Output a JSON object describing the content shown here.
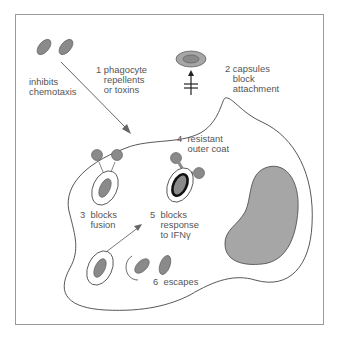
{
  "figure": {
    "colors": {
      "bacterium_fill": "#8a8a8a",
      "nucleus_fill": "#a6a6a6",
      "outline": "#444444",
      "frame": "#9a9a9a",
      "text": "#555555"
    },
    "labels": {
      "inhibits": "inhibits\nchemotaxis",
      "m1": "1 phagocyte\n   repellents\n   or toxins",
      "m2": "2 capsules\n   block\n   attachment",
      "m3": "3  blocks\n    fusion",
      "m4": "4  resistant\n    outer coat",
      "m5": "5  blocks\n    response\n    to IFNγ",
      "m6": "6  escapes"
    }
  }
}
